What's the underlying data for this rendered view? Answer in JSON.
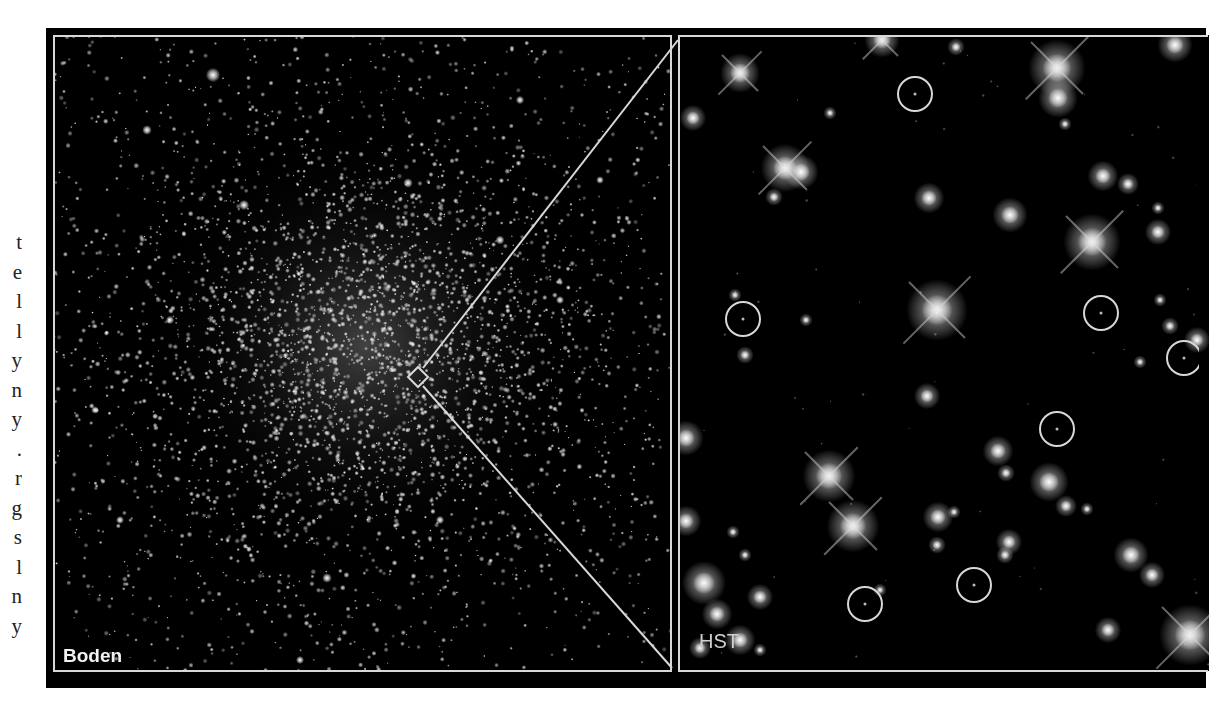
{
  "margin_text": {
    "clipped_line_endings": [
      "t",
      "e",
      "l",
      "l",
      "y",
      "n",
      "y",
      ".",
      "r",
      "g",
      "s",
      "l",
      "n",
      "y"
    ]
  },
  "figure": {
    "panels": [
      {
        "id": "left",
        "label": "Boden",
        "description": "Ground-based image of globular star cluster",
        "background": "#000000",
        "frame_color": "#d8d8d8"
      },
      {
        "id": "right",
        "label": "HST",
        "description": "Hubble Space Telescope zoom-in of cluster core region",
        "background": "#000000",
        "frame_color": "#d8d8d8"
      }
    ],
    "zoom_marker": {
      "shape": "diamond",
      "center": [
        418,
        377
      ],
      "half_diagonal": 10,
      "lines": [
        {
          "from": [
            423,
            368
          ],
          "to": [
            678,
            40
          ]
        },
        {
          "from": [
            423,
            386
          ],
          "to": [
            672,
            668
          ]
        }
      ],
      "color": "#d8d8d8"
    },
    "cluster": {
      "center": [
        365,
        345
      ],
      "core_radius": 95,
      "star_count_dense": 2600,
      "star_count_field": 1400,
      "bright_stars": [
        [
          213,
          75,
          4.5
        ],
        [
          147,
          130,
          3
        ],
        [
          244,
          205,
          3.2
        ],
        [
          408,
          183,
          3
        ],
        [
          327,
          578,
          3
        ],
        [
          170,
          320,
          2.6
        ],
        [
          500,
          240,
          2.8
        ],
        [
          520,
          100,
          2.6
        ],
        [
          560,
          300,
          2.5
        ],
        [
          95,
          410,
          2.4
        ],
        [
          300,
          660,
          2.5
        ],
        [
          440,
          520,
          2.6
        ],
        [
          600,
          180,
          2.4
        ],
        [
          120,
          520,
          2.5
        ]
      ]
    },
    "hst_stars": [
      [
        740,
        73,
        9,
        1
      ],
      [
        882,
        40,
        8,
        1
      ],
      [
        956,
        47,
        4,
        0
      ],
      [
        1057,
        68,
        13,
        1
      ],
      [
        1058,
        98,
        9,
        0
      ],
      [
        1175,
        45,
        8,
        0
      ],
      [
        693,
        118,
        6,
        0
      ],
      [
        830,
        113,
        3,
        0
      ],
      [
        785,
        168,
        11,
        1
      ],
      [
        801,
        172,
        8,
        0
      ],
      [
        774,
        197,
        4,
        0
      ],
      [
        929,
        198,
        7,
        0
      ],
      [
        1010,
        215,
        8,
        0
      ],
      [
        1103,
        176,
        7,
        0
      ],
      [
        1128,
        184,
        5,
        0
      ],
      [
        1092,
        242,
        13,
        1
      ],
      [
        1158,
        232,
        6,
        0
      ],
      [
        1158,
        208,
        3,
        0
      ],
      [
        1065,
        124,
        3,
        0
      ],
      [
        735,
        295,
        3,
        0
      ],
      [
        937,
        310,
        14,
        1
      ],
      [
        806,
        320,
        3,
        0
      ],
      [
        745,
        355,
        4,
        0
      ],
      [
        927,
        396,
        6,
        0
      ],
      [
        1170,
        326,
        4,
        0
      ],
      [
        1140,
        362,
        3,
        0
      ],
      [
        686,
        438,
        8,
        0
      ],
      [
        829,
        476,
        12,
        1
      ],
      [
        853,
        526,
        12,
        1
      ],
      [
        998,
        451,
        7,
        0
      ],
      [
        1006,
        473,
        4,
        0
      ],
      [
        938,
        517,
        7,
        0
      ],
      [
        954,
        512,
        3,
        0
      ],
      [
        937,
        545,
        4,
        0
      ],
      [
        1049,
        482,
        9,
        0
      ],
      [
        1066,
        506,
        5,
        0
      ],
      [
        1087,
        509,
        3,
        0
      ],
      [
        1009,
        542,
        6,
        0
      ],
      [
        1005,
        555,
        4,
        0
      ],
      [
        733,
        532,
        3,
        0
      ],
      [
        686,
        521,
        7,
        0
      ],
      [
        704,
        583,
        10,
        0
      ],
      [
        717,
        614,
        7,
        0
      ],
      [
        745,
        555,
        3,
        0
      ],
      [
        760,
        597,
        6,
        0
      ],
      [
        1131,
        555,
        8,
        0
      ],
      [
        1152,
        575,
        6,
        0
      ],
      [
        1108,
        630,
        6,
        0
      ],
      [
        1190,
        635,
        14,
        1
      ],
      [
        740,
        640,
        7,
        0
      ],
      [
        700,
        648,
        5,
        0
      ],
      [
        760,
        650,
        3,
        0
      ],
      [
        880,
        590,
        3,
        0
      ],
      [
        1160,
        300,
        3,
        0
      ],
      [
        1197,
        340,
        6,
        0
      ]
    ],
    "hst_circles": {
      "radius": 17,
      "color": "#d8d8d8",
      "centers": [
        [
          915,
          94
        ],
        [
          743,
          319
        ],
        [
          1101,
          313
        ],
        [
          1184,
          358
        ],
        [
          1057,
          429
        ],
        [
          974,
          585
        ],
        [
          865,
          604
        ]
      ]
    }
  }
}
